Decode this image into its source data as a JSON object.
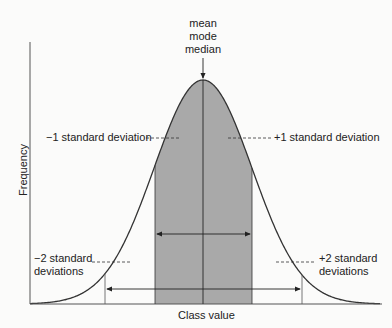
{
  "labels": {
    "center_top": [
      "mean",
      "mode",
      "median"
    ],
    "minus1": "−1 standard deviation",
    "plus1": "+1 standard deviation",
    "minus2": [
      "−2 standard",
      "deviations"
    ],
    "plus2": [
      "+2 standard",
      "deviations"
    ],
    "xlabel": "Class value",
    "ylabel": "Frequency"
  },
  "colors": {
    "shade": "#a9a9a9",
    "line": "#333333",
    "background": "#fbfbfa"
  },
  "chart_data": {
    "type": "area",
    "title": "",
    "xlabel": "Class value",
    "ylabel": "Frequency",
    "annotations": [
      "mean",
      "mode",
      "median",
      "−1 standard deviation",
      "+1 standard deviation",
      "−2 standard deviations",
      "+2 standard deviations"
    ],
    "shaded_range_sd": [
      -1,
      1
    ],
    "marked_sd": [
      -2,
      -1,
      0,
      1,
      2
    ],
    "grid": false,
    "legend": "none"
  }
}
